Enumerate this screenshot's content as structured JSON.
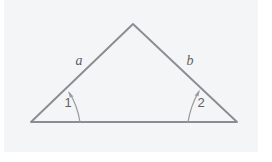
{
  "figure": {
    "kind": "geometry-diagram",
    "subject": "triangle-with-two-marked-base-angles",
    "canvas": {
      "width": 272,
      "height": 162
    },
    "colors": {
      "page_background": "#ffffff",
      "plate_background": "#f4f5f6",
      "stroke": "#8b8e91",
      "arc_stroke": "#9a9da0",
      "label_text": "#5e6164"
    },
    "plate": {
      "x": 4,
      "y": 0,
      "width": 254,
      "height": 152
    }
  },
  "shape": {
    "name": "triangle",
    "stroke_width": 1.9,
    "vertices": [
      {
        "id": "apex",
        "x": 133,
        "y": 24
      },
      {
        "id": "bottom-left",
        "x": 31,
        "y": 122
      },
      {
        "id": "bottom-right",
        "x": 237,
        "y": 122
      }
    ]
  },
  "side_labels": [
    {
      "id": "side-a",
      "text": "a",
      "x": 79,
      "y": 65,
      "style": "italic"
    },
    {
      "id": "side-b",
      "text": "b",
      "x": 190,
      "y": 65,
      "style": "italic"
    }
  ],
  "angle_labels": [
    {
      "id": "angle-1",
      "text": "1",
      "x": 68,
      "y": 107
    },
    {
      "id": "angle-2",
      "text": "2",
      "x": 201,
      "y": 107
    }
  ],
  "angle_arcs": [
    {
      "id": "arc-1",
      "path": "M 80 122 C 78 110 74 100 69.5 93",
      "arrow_tip": {
        "x": 68,
        "y": 91
      },
      "arrow_points": "68,91 73.5,96.5 69.8,97.4"
    },
    {
      "id": "arc-2",
      "path": "M 188 122 C 190 110 194 100 198.5 92",
      "arrow_tip": {
        "x": 200,
        "y": 89.5
      },
      "arrow_points": "200,89.5 194.6,95.5 198.4,96.2"
    }
  ]
}
